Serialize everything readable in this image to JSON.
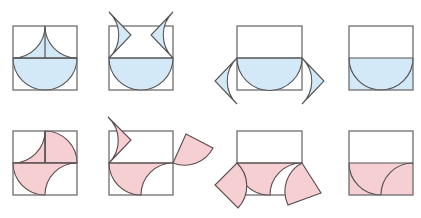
{
  "diagram": {
    "colors": {
      "row1_fill": "#d4e9f8",
      "row2_fill": "#f6cfd3",
      "outline": "#6e6e6e"
    },
    "rows": [
      {
        "name": "top",
        "fill": "blue",
        "steps": [
          "cusp-over-semicircle",
          "cusp pieces lifted",
          "cusp pieces moved to sides",
          "half-rectangle filled"
        ]
      },
      {
        "name": "bottom",
        "fill": "pink",
        "steps": [
          "pinwheel quarter shapes",
          "pieces lifted",
          "pieces moved to sides",
          "half-rectangle filled"
        ]
      }
    ]
  }
}
